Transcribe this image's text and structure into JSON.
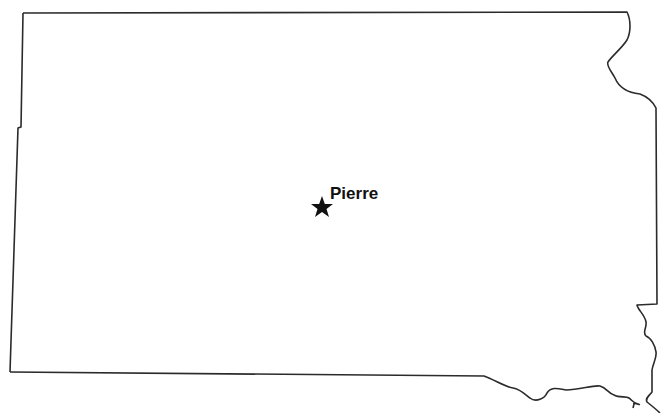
{
  "map": {
    "region": "South Dakota",
    "outline_color": "#2b2b2b",
    "background": "#ffffff",
    "cities": [
      {
        "name": "Pierre",
        "marker": "star-icon",
        "type": "capital",
        "x": 322,
        "y": 208
      }
    ]
  }
}
